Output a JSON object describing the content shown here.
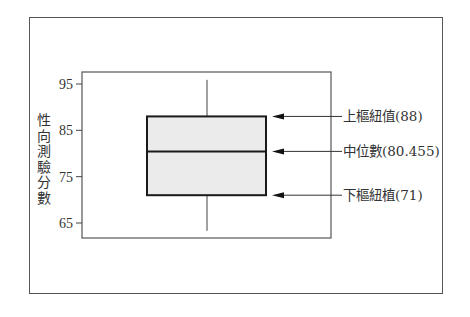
{
  "chart_data": {
    "type": "box",
    "title": "",
    "xlabel": "",
    "ylabel": "性向測驗分數",
    "ylim": [
      62,
      97
    ],
    "yticks": [
      65,
      75,
      85,
      95
    ],
    "ytick_labels": [
      "65",
      "75",
      "85",
      "95"
    ],
    "grid": false,
    "boxes": [
      {
        "whisker_low": 63.3,
        "q1": 71,
        "median": 80.455,
        "q3": 88,
        "whisker_high": 95.9
      }
    ],
    "annotations": [
      {
        "text": "上樞紐值(88)",
        "value": 88,
        "arrow": true
      },
      {
        "text": "中位數(80.455)",
        "value": 80.455,
        "arrow": true
      },
      {
        "text": "下樞紐植(71)",
        "value": 71,
        "arrow": true
      }
    ],
    "colors": {
      "box_fill": "#ebebeb",
      "box_edge": "#1a1a1a",
      "frame": "#555555"
    }
  }
}
